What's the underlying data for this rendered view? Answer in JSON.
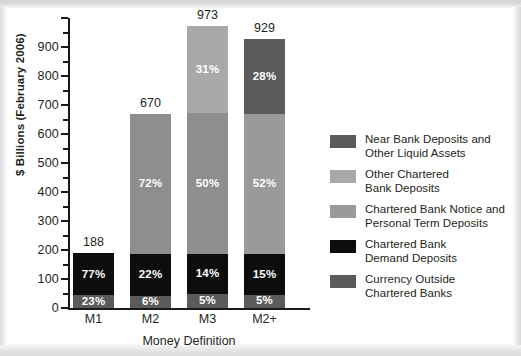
{
  "chart_data": {
    "type": "bar",
    "subtype": "stacked-bar-percentage",
    "title": "",
    "xlabel": "Money Definition",
    "ylabel": "$ Billions (February 2006)",
    "categories": [
      "M1",
      "M2",
      "M3",
      "M2+"
    ],
    "totals": [
      188,
      670,
      973,
      929
    ],
    "ylim": [
      0,
      1000
    ],
    "ytick_labels": [
      "0",
      "100",
      "200",
      "300",
      "400",
      "500",
      "600",
      "700",
      "800",
      "900"
    ],
    "ytick_values": [
      0,
      100,
      200,
      300,
      400,
      500,
      600,
      700,
      800,
      900
    ],
    "minor_tick_interval": 50,
    "grid": false,
    "legend_position": "right",
    "series": [
      {
        "name": "Currency Outside Chartered Banks",
        "color": "#5b5b5b",
        "values": [
          23,
          6,
          5,
          5
        ],
        "labels": [
          "23%",
          "6%",
          "5%",
          "5%"
        ]
      },
      {
        "name": "Chartered Bank Demand Deposits",
        "color": "#0d0d0d",
        "values": [
          77,
          22,
          14,
          15
        ],
        "labels": [
          "77%",
          "22%",
          "14%",
          "15%"
        ]
      },
      {
        "name": "Chartered Bank Notice and Personal Term Deposits",
        "color": "#9a9a9a",
        "values": [
          0,
          72,
          50,
          52
        ],
        "labels": [
          "",
          "72%",
          "50%",
          "52%"
        ]
      },
      {
        "name": "Other Chartered Bank Deposits",
        "color": "#a9a9a9",
        "values": [
          0,
          0,
          31,
          0
        ],
        "labels": [
          "",
          "",
          "31%",
          ""
        ]
      },
      {
        "name": "Near Bank Deposits and Other Liquid Assets",
        "color": "#5b5b5b",
        "values": [
          0,
          0,
          0,
          28
        ],
        "labels": [
          "",
          "",
          "",
          "28%"
        ]
      }
    ]
  },
  "axes": {
    "y_title": "$ Billions (February 2006)",
    "x_title": "Money Definition",
    "y_labels": [
      "900",
      "800",
      "700",
      "600",
      "500",
      "400",
      "300",
      "200",
      "100",
      "0"
    ]
  },
  "bars": [
    {
      "category": "M1",
      "total_label": "188",
      "segments": [
        {
          "label": "23%",
          "color": "#5b5b5b",
          "pct": 23
        },
        {
          "label": "77%",
          "color": "#0d0d0d",
          "pct": 77
        }
      ]
    },
    {
      "category": "M2",
      "total_label": "670",
      "segments": [
        {
          "label": "6%",
          "color": "#5b5b5b",
          "pct": 6
        },
        {
          "label": "22%",
          "color": "#0d0d0d",
          "pct": 22
        },
        {
          "label": "72%",
          "color": "#8e8e8e",
          "pct": 72
        }
      ]
    },
    {
      "category": "M3",
      "total_label": "973",
      "segments": [
        {
          "label": "5%",
          "color": "#5b5b5b",
          "pct": 5
        },
        {
          "label": "14%",
          "color": "#0d0d0d",
          "pct": 14
        },
        {
          "label": "50%",
          "color": "#8e8e8e",
          "pct": 50
        },
        {
          "label": "31%",
          "color": "#a9a9a9",
          "pct": 31
        }
      ]
    },
    {
      "category": "M2+",
      "total_label": "929",
      "segments": [
        {
          "label": "5%",
          "color": "#5b5b5b",
          "pct": 5
        },
        {
          "label": "15%",
          "color": "#0d0d0d",
          "pct": 15
        },
        {
          "label": "52%",
          "color": "#9a9a9a",
          "pct": 52
        },
        {
          "label": "28%",
          "color": "#5b5b5b",
          "pct": 28
        }
      ]
    }
  ],
  "legend": {
    "items": [
      {
        "swatch_color": "#5b5b5b",
        "line1": "Near Bank Deposits and",
        "line2": "Other Liquid Assets"
      },
      {
        "swatch_color": "#a9a9a9",
        "line1": "Other Chartered",
        "line2": "Bank Deposits"
      },
      {
        "swatch_color": "#9a9a9a",
        "line1": "Chartered Bank Notice and",
        "line2": "Personal Term Deposits"
      },
      {
        "swatch_color": "#0d0d0d",
        "line1": "Chartered Bank",
        "line2": "Demand Deposits"
      },
      {
        "swatch_color": "#5b5b5b",
        "line1": "Currency Outside",
        "line2": "Chartered Banks"
      }
    ]
  },
  "colors": {
    "background": "#ffffff",
    "axis": "#1a1a1a",
    "text": "#231f20",
    "dark_gray": "#5b5b5b",
    "black": "#0d0d0d",
    "mid_gray": "#8e8e8e",
    "light_gray": "#a9a9a9"
  }
}
